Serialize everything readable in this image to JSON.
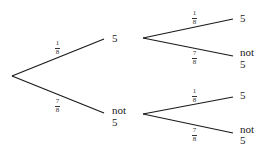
{
  "tree": {
    "level1": {
      "top": {
        "probability": {
          "numerator": "1",
          "denominator": "8"
        },
        "outcome": "5"
      },
      "bottom": {
        "probability": {
          "numerator": "7",
          "denominator": "8"
        },
        "outcome_line1": "not",
        "outcome_line2": "5"
      }
    },
    "level2_from_5": {
      "top": {
        "probability": {
          "numerator": "1",
          "denominator": "8"
        },
        "outcome": "5"
      },
      "bottom": {
        "probability": {
          "numerator": "7",
          "denominator": "8"
        },
        "outcome_line1": "not",
        "outcome_line2": "5"
      }
    },
    "level2_from_not5": {
      "top": {
        "probability": {
          "numerator": "1",
          "denominator": "8"
        },
        "outcome": "5"
      },
      "bottom": {
        "probability": {
          "numerator": "7",
          "denominator": "8"
        },
        "outcome_line1": "not",
        "outcome_line2": "5"
      }
    }
  },
  "colors": {
    "line": "#1a1a1a",
    "text": "#1a1a1a"
  }
}
